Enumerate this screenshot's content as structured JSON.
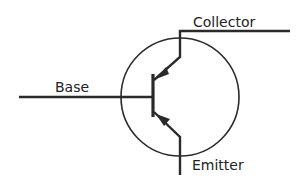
{
  "diagram": {
    "type": "transistor-symbol",
    "labels": {
      "base": "Base",
      "collector": "Collector",
      "emitter": "Emitter"
    },
    "colors": {
      "stroke": "#2a2a2a",
      "background": "#ffffff"
    }
  }
}
